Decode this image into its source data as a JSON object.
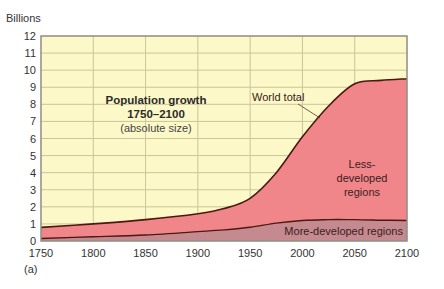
{
  "chart_data": {
    "type": "area",
    "title": "Population growth 1750–2100",
    "subtitle": "(absolute size)",
    "panel_label": "(a)",
    "ylabel": "Billions",
    "xlabel": "",
    "xlim": [
      1750,
      2100
    ],
    "ylim": [
      0,
      12
    ],
    "grid": true,
    "x_ticks": [
      "1750",
      "1800",
      "1850",
      "1900",
      "1950",
      "2000",
      "2050",
      "2100"
    ],
    "y_ticks": [
      "0",
      "1",
      "2",
      "3",
      "4",
      "5",
      "6",
      "7",
      "8",
      "9",
      "10",
      "11",
      "12"
    ],
    "x": [
      1750,
      1800,
      1850,
      1900,
      1925,
      1950,
      1975,
      2000,
      2025,
      2050,
      2075,
      2100
    ],
    "series": [
      {
        "name": "World total",
        "values": [
          0.8,
          1.0,
          1.25,
          1.6,
          1.9,
          2.5,
          4.0,
          6.1,
          7.9,
          9.2,
          9.4,
          9.5
        ],
        "color": "#4a1a10"
      },
      {
        "name": "More-developed regions",
        "values": [
          0.15,
          0.25,
          0.35,
          0.55,
          0.65,
          0.8,
          1.05,
          1.2,
          1.25,
          1.25,
          1.22,
          1.2
        ],
        "color": "#c48a90"
      }
    ],
    "areas": [
      {
        "name": "Less-developed regions",
        "color": "#f0868a"
      },
      {
        "name": "More-developed regions",
        "color": "#c48a90"
      }
    ],
    "annotations": [
      {
        "text": "World total",
        "type": "leader-label"
      },
      {
        "text": "Less-developed regions",
        "lines": [
          "Less-",
          "developed",
          "regions"
        ]
      },
      {
        "text": "More-developed regions"
      }
    ],
    "colors": {
      "plot_background": "#fdf8c8",
      "gridline": "#c9c59c",
      "frame": "#8f8d82",
      "less_developed": "#f0868a",
      "more_developed": "#c48a90",
      "curve": "#4a1a10"
    }
  },
  "labels": {
    "ylabel": "Billions",
    "title_line1": "Population growth",
    "title_line2": "1750–2100",
    "title_line3": "(absolute size)",
    "world_total": "World total",
    "less_dev_1": "Less-",
    "less_dev_2": "developed",
    "less_dev_3": "regions",
    "more_dev": "More-developed regions",
    "panel": "(a)"
  }
}
